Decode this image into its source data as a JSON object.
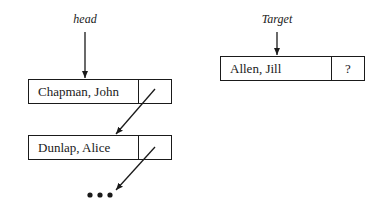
{
  "labels": {
    "head": "head",
    "target": "Target"
  },
  "list_nodes": [
    {
      "name": "Chapman, John",
      "pointer": ""
    },
    {
      "name": "Dunlap, Alice",
      "pointer": ""
    }
  ],
  "target_node": {
    "name": "Allen, Jill",
    "pointer": "?"
  },
  "continuation": "•••"
}
